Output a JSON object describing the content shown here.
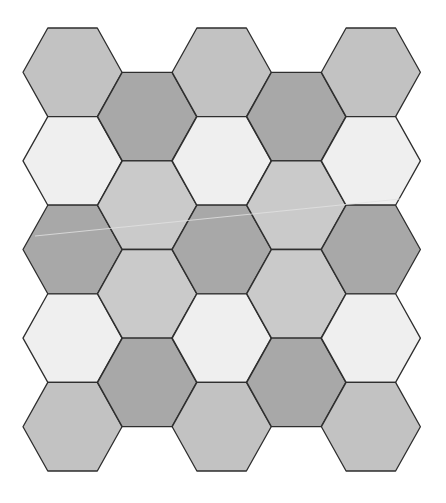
{
  "canvas": {
    "width": 446,
    "height": 503,
    "background": "#ffffff"
  },
  "geometry": {
    "origin_x": 23,
    "origin_y": 28,
    "hex_width": 99,
    "hex_height": 88.6,
    "column_pitch": 74.6,
    "odd_column_offset_y": 44.3,
    "stroke": "#2e2e2e",
    "stroke_width": 1.3
  },
  "palette": {
    "medium": "#c2c2c2",
    "light": "#efefef",
    "dark": "#a8a8a8",
    "medium_light": "#cacaca"
  },
  "columns": [
    {
      "index": 0,
      "cells": [
        "medium",
        "light",
        "dark",
        "light",
        "medium"
      ]
    },
    {
      "index": 1,
      "cells": [
        "dark",
        "medium_light",
        "medium_light",
        "dark"
      ]
    },
    {
      "index": 2,
      "cells": [
        "medium",
        "light",
        "dark",
        "light",
        "medium"
      ]
    },
    {
      "index": 3,
      "cells": [
        "dark",
        "medium_light",
        "medium_light",
        "dark"
      ]
    },
    {
      "index": 4,
      "cells": [
        "medium",
        "light",
        "dark",
        "light",
        "medium"
      ]
    }
  ],
  "artifact_line": {
    "x1": 35,
    "y1": 236,
    "x2": 400,
    "y2": 199,
    "color": "#e2e2e2",
    "width": 1
  }
}
